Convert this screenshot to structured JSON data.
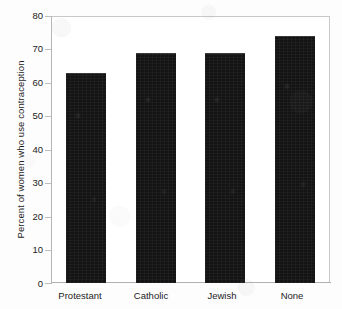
{
  "chart_data": {
    "type": "bar",
    "title": "",
    "subtitle": "",
    "xlabel": "",
    "ylabel": "Percent of women who use contraception",
    "categories": [
      "Protestant",
      "Catholic",
      "Jewish",
      "None"
    ],
    "values": [
      63,
      69,
      69,
      74
    ],
    "series": [
      {
        "name": "Percent of women who use contraception",
        "values": [
          63,
          69,
          69,
          74
        ]
      }
    ],
    "ylim": [
      0,
      80
    ],
    "yticks": [
      0,
      10,
      20,
      30,
      40,
      50,
      60,
      70,
      80
    ],
    "ytick_labels": [
      "0",
      "10",
      "20",
      "30",
      "40",
      "50",
      "60",
      "70",
      "80"
    ],
    "grid": false,
    "legend": false,
    "legend_position": "none",
    "bar_color": "#141414",
    "frame_color": "#c9c9c9",
    "background_color": "#fdfdfd",
    "annotations": []
  },
  "figure": {
    "axis_title_y": "Percent of women who use contraception"
  }
}
